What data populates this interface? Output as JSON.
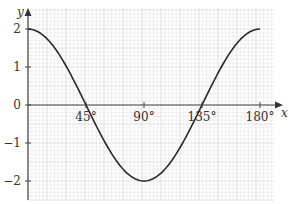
{
  "chart_data": {
    "type": "line",
    "title": "",
    "xlabel": "x",
    "ylabel": "y",
    "function": "y = 2cos(2x)",
    "xlim": [
      0,
      180
    ],
    "ylim": [
      -2.5,
      2.5
    ],
    "grid": true,
    "x_ticks": [
      {
        "value": 45,
        "label": "45°"
      },
      {
        "value": 90,
        "label": "90°"
      },
      {
        "value": 135,
        "label": "135°"
      },
      {
        "value": 180,
        "label": "180°"
      }
    ],
    "y_ticks": [
      {
        "value": 2,
        "label": "2"
      },
      {
        "value": 1,
        "label": "1"
      },
      {
        "value": 0,
        "label": "0"
      },
      {
        "value": -1,
        "label": "−1"
      },
      {
        "value": -2,
        "label": "−2"
      }
    ],
    "series": [
      {
        "name": "y = 2cos(2x)",
        "x": [
          0,
          15,
          30,
          45,
          60,
          75,
          90,
          105,
          120,
          135,
          150,
          165,
          180
        ],
        "values": [
          2,
          1.73,
          1,
          0,
          -1,
          -1.73,
          -2,
          -1.73,
          -1,
          0,
          1,
          1.73,
          2
        ]
      }
    ],
    "colors": {
      "curve": "#2a2a2a",
      "axis": "#444444",
      "grid_minor": "#e6e6e6",
      "grid_major": "#cfcfcf"
    }
  }
}
